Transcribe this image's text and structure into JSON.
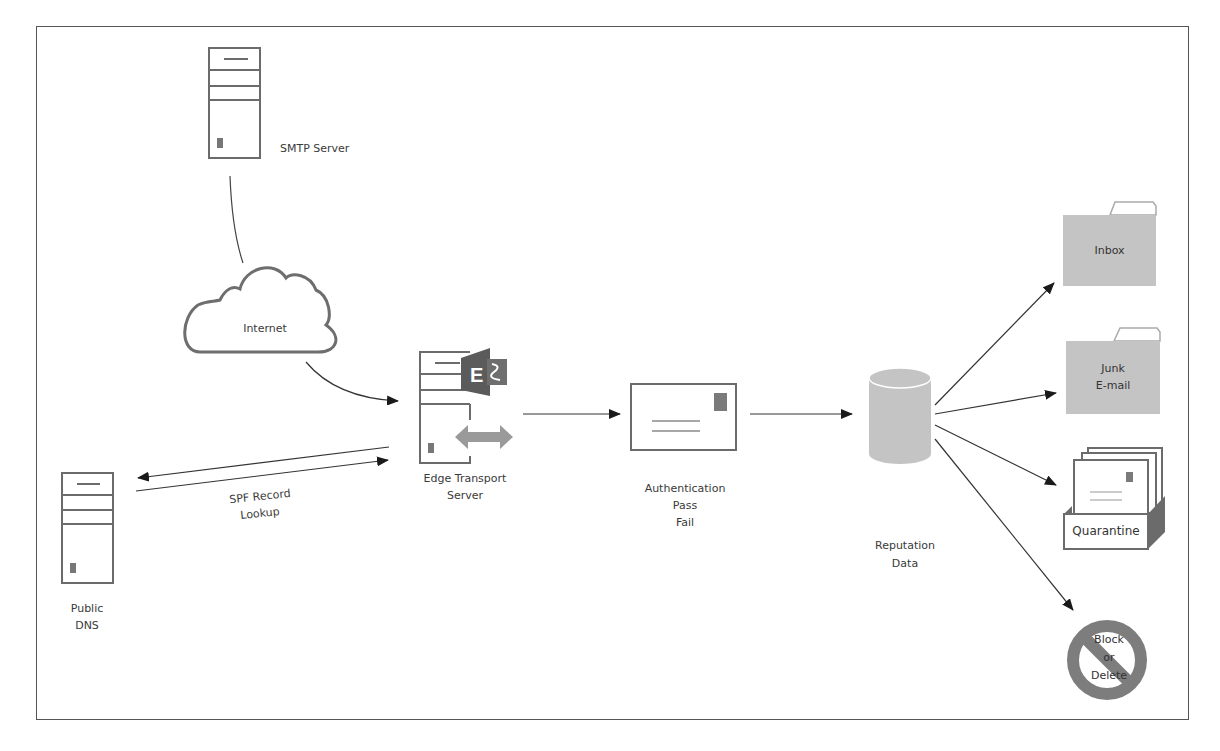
{
  "diagram": {
    "title": "",
    "colors": {
      "stroke": "#6b6b6b",
      "fill_gray": "#c4c4c4",
      "exchange_orange": "#6a6a6a",
      "arrow_gray": "#9a9a9a",
      "block_circle": "#7d7d7d",
      "text": "#3a3a3a"
    },
    "nodes": {
      "smtp_server": {
        "label": "SMTP Server",
        "icon": "server-tower-icon"
      },
      "internet": {
        "label": "Internet",
        "icon": "cloud-icon"
      },
      "edge_transport": {
        "label_line1": "Edge Transport",
        "label_line2": "Server",
        "icon": "exchange-edge-server-icon"
      },
      "public_dns": {
        "label_line1": "Public",
        "label_line2": "DNS",
        "icon": "server-tower-icon"
      },
      "authentication": {
        "label_line1": "Authentication",
        "label_line2": "Pass",
        "label_line3": "Fail",
        "icon": "envelope-icon"
      },
      "reputation": {
        "label_line1": "Reputation",
        "label_line2": "Data",
        "icon": "database-cylinder-icon"
      },
      "inbox": {
        "label": "Inbox",
        "icon": "folder-icon"
      },
      "junk": {
        "label_line1": "Junk",
        "label_line2": "E-mail",
        "icon": "folder-icon"
      },
      "quarantine": {
        "label": "Quarantine",
        "icon": "quarantine-box-icon"
      },
      "block": {
        "label_line1": "Block",
        "label_line2": "or",
        "label_line3": "Delete",
        "icon": "prohibited-icon"
      }
    },
    "edges": [
      {
        "from": "SMTP Server",
        "to": "Internet",
        "label": ""
      },
      {
        "from": "Internet",
        "to": "Edge Transport Server",
        "label": ""
      },
      {
        "from": "Edge Transport Server",
        "to": "Public DNS",
        "label": "SPF Record Lookup"
      },
      {
        "from": "Public DNS",
        "to": "Edge Transport Server",
        "label": ""
      },
      {
        "from": "Edge Transport Server",
        "to": "Authentication",
        "label": ""
      },
      {
        "from": "Authentication",
        "to": "Reputation Data",
        "label": ""
      },
      {
        "from": "Reputation Data",
        "to": "Inbox",
        "label": ""
      },
      {
        "from": "Reputation Data",
        "to": "Junk E-mail",
        "label": ""
      },
      {
        "from": "Reputation Data",
        "to": "Quarantine",
        "label": ""
      },
      {
        "from": "Reputation Data",
        "to": "Block or Delete",
        "label": ""
      }
    ],
    "edge_labels": {
      "spf_line1": "SPF Record",
      "spf_line2": "Lookup"
    }
  }
}
